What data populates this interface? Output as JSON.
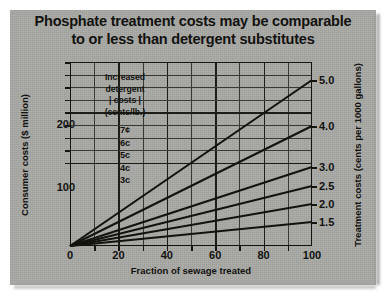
{
  "title": {
    "line1": "Phosphate treatment costs may be comparable",
    "line2": "to or less than detergent substitutes"
  },
  "legend": {
    "header_line1": "Increased",
    "header_line2": "detergent",
    "header_line3": "| costs |",
    "header_line4": "(cents/lb.)",
    "items": [
      "7¢",
      "6c",
      "5c",
      "4c",
      "3c"
    ]
  },
  "chart_data": {
    "type": "line",
    "title": "Phosphate treatment costs may be comparable to or less than detergent substitutes",
    "xlabel": "Fraction of sewage treated",
    "ylabel": "Consumer costs ($ million)",
    "y2label": "Treatment costs (cents per 1000 gallons)",
    "xlim": [
      0,
      100
    ],
    "xticks": [
      0,
      20,
      40,
      60,
      80,
      100
    ],
    "xtick_labels": [
      "0",
      "20",
      "40",
      "60",
      "80",
      "100"
    ],
    "x_minor_step": 10,
    "ylim": [
      0,
      290
    ],
    "yticks": [
      100,
      200
    ],
    "ytick_labels": [
      "100",
      "200"
    ],
    "y2_tick_labels": [
      "5.0",
      "4.0",
      "3.0",
      "2.5",
      "2.0",
      "1.5"
    ],
    "y2_tick_values": [
      5.0,
      4.0,
      3.0,
      2.5,
      2.0,
      1.5
    ],
    "grid": true,
    "legend_position": "inside-upper-left",
    "x": [
      0,
      100
    ],
    "series": [
      {
        "name": "5.0",
        "values": [
          0,
          5.0
        ]
      },
      {
        "name": "4.0",
        "values": [
          0,
          4.0
        ]
      },
      {
        "name": "3.0",
        "values": [
          0,
          3.0
        ]
      },
      {
        "name": "2.5",
        "values": [
          0,
          2.5
        ]
      },
      {
        "name": "2.0",
        "values": [
          0,
          2.0
        ]
      },
      {
        "name": "1.5",
        "values": [
          0,
          1.5
        ]
      }
    ],
    "note": "Six straight lines fan out from the origin to the right-axis treatment-cost values."
  },
  "colors": {
    "panel": "#a9a9a6",
    "ink": "#12120f",
    "grid": "#3a3a33"
  }
}
